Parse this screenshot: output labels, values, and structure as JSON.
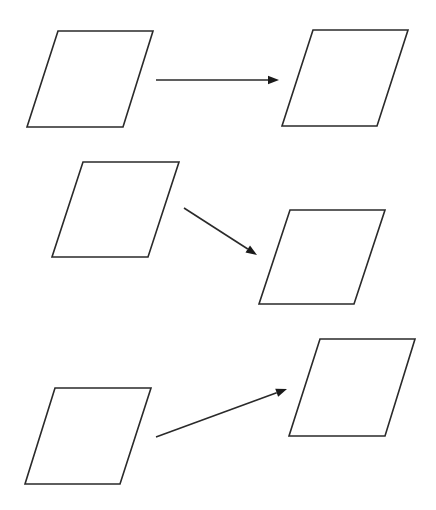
{
  "diagram": {
    "background": "#ffffff",
    "stroke_color": "#2a2a2a",
    "shapes": [
      {
        "id": "para-1",
        "type": "parallelogram",
        "points": [
          [
            58,
            31
          ],
          [
            153,
            31
          ],
          [
            123,
            127
          ],
          [
            27,
            127
          ]
        ]
      },
      {
        "id": "para-2",
        "type": "parallelogram",
        "points": [
          [
            313,
            30
          ],
          [
            408,
            30
          ],
          [
            377,
            126
          ],
          [
            282,
            126
          ]
        ]
      },
      {
        "id": "para-3",
        "type": "parallelogram",
        "points": [
          [
            83,
            162
          ],
          [
            179,
            162
          ],
          [
            148,
            257
          ],
          [
            52,
            257
          ]
        ]
      },
      {
        "id": "para-4",
        "type": "parallelogram",
        "points": [
          [
            290,
            210
          ],
          [
            385,
            210
          ],
          [
            354,
            304
          ],
          [
            259,
            304
          ]
        ]
      },
      {
        "id": "para-5",
        "type": "parallelogram",
        "points": [
          [
            55,
            388
          ],
          [
            151,
            388
          ],
          [
            120,
            484
          ],
          [
            25,
            484
          ]
        ]
      },
      {
        "id": "para-6",
        "type": "parallelogram",
        "points": [
          [
            320,
            339
          ],
          [
            415,
            339
          ],
          [
            385,
            436
          ],
          [
            289,
            436
          ]
        ]
      }
    ],
    "arrows": [
      {
        "id": "arrow-1",
        "from": "para-1",
        "to": "para-2",
        "start": [
          156,
          80
        ],
        "end": [
          279,
          80
        ]
      },
      {
        "id": "arrow-2",
        "from": "para-3",
        "to": "para-4",
        "start": [
          184,
          208
        ],
        "end": [
          257,
          255
        ]
      },
      {
        "id": "arrow-3",
        "from": "para-5",
        "to": "para-6",
        "start": [
          156,
          437
        ],
        "end": [
          287,
          389
        ]
      }
    ]
  }
}
